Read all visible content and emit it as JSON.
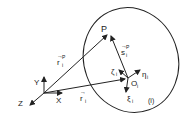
{
  "diagram": {
    "labels": {
      "P": "P",
      "Y": "Y",
      "X": "X",
      "Z": "Z",
      "r_i_P": "r",
      "r_i_P_sub": "i",
      "r_i_P_sup": "P",
      "r_i": "r",
      "r_i_sub": "i",
      "s_i_P": "s",
      "s_i_P_sub": "i",
      "s_i_P_sup": "P",
      "zeta": "ζ",
      "zeta_sub": "i",
      "eta": "η",
      "eta_sub": "i",
      "xi": "ξ",
      "xi_sub": "i",
      "O": "O",
      "O_sub": "i",
      "body_label": "(i)"
    },
    "colors": {
      "stroke": "#222222",
      "background": "#ffffff"
    }
  }
}
